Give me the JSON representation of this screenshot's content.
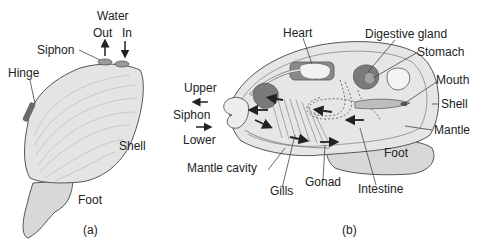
{
  "panel_a": {
    "caption": "(a)",
    "labels": {
      "water": "Water",
      "out": "Out",
      "in": "In",
      "siphon": "Siphon",
      "hinge": "Hinge",
      "shell": "Shell",
      "foot": "Foot"
    }
  },
  "panel_b": {
    "caption": "(b)",
    "labels": {
      "heart": "Heart",
      "digestive_gland": "Digestive gland",
      "stomach": "Stomach",
      "mouth": "Mouth",
      "shell": "Shell",
      "mantle": "Mantle",
      "foot": "Foot",
      "upper": "Upper",
      "siphon": "Siphon",
      "lower": "Lower",
      "mantle_cavity": "Mantle cavity",
      "gills": "Gills",
      "gonad": "Gonad",
      "intestine": "Intestine"
    }
  },
  "colors": {
    "shell_fill": "#e4e4e4",
    "organ_dark": "#7a7a7a",
    "foot_fill": "#d8d8d8",
    "outline": "#555555"
  }
}
